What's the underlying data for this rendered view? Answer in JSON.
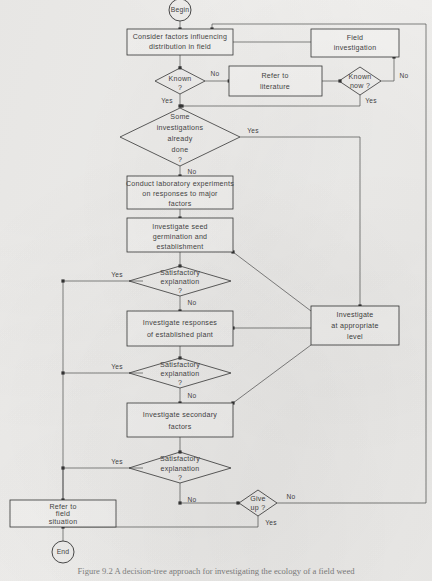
{
  "figure": {
    "background_color": "#f2f1ef",
    "line_color": "#2e2e2e",
    "text_color": "#3b3b3b",
    "caption": "Figure 9.2  A decision-tree approach for investigating the ecology of a field weed"
  },
  "terminators": {
    "begin": "Begin",
    "end": "End"
  },
  "processes": {
    "consider_factors": "Consider factors influencing\ndistribution in field",
    "field_investigation": "Field\ninvestigation",
    "refer_literature": "Refer to\nliterature",
    "conduct_lab": "Conduct laboratory experiments\non responses to major\nfactors",
    "investigate_seed": "Investigate seed\ngermination and\nestablishment",
    "investigate_established": "Investigate responses\nof established plant",
    "investigate_level": "Investigate\nat appropriate\nlevel",
    "investigate_secondary": "Investigate secondary\nfactors",
    "refer_field": "Refer to\nfield\nsituation"
  },
  "decisions": {
    "known": "Known\n?",
    "known_now": "Known\nnow ?",
    "some_investigations": "Some\ninvestigations\nalready\ndone\n?",
    "satisfactory_1": "Satisfactory\nexplanation\n?",
    "satisfactory_2": "Satisfactory\nexplanation\n?",
    "satisfactory_3": "Satisfactory\nexplanation\n?",
    "give_up": "Give\nup ?"
  },
  "edge_labels": {
    "known_no": "No",
    "known_yes": "Yes",
    "known_now_no": "No",
    "known_now_yes": "Yes",
    "some_yes": "Yes",
    "some_no": "No",
    "sat1_yes": "Yes",
    "sat1_no": "No",
    "sat2_yes": "Yes",
    "sat2_no": "No",
    "sat3_yes": "Yes",
    "sat3_no": "No",
    "give_up_no": "No",
    "give_up_yes": "Yes"
  }
}
